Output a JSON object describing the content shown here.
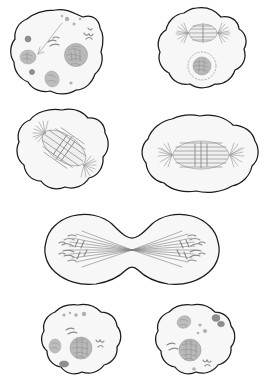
{
  "figure": {
    "style": "grayscale pencil line drawing",
    "background_color": "#ffffff",
    "outline_color": "#1a1a1a",
    "cytoplasm_color": "#f7f7f7",
    "structure_color": "#9b9b9b",
    "nucleus_color": "#b9b9b9",
    "panel_count": 6,
    "layout": "3 rows: two panels, two panels, one wide panel, two panels"
  },
  "panels": [
    {
      "id": "panel-prophase",
      "stage_name": "Prophase",
      "row": 1,
      "column": 1,
      "cell_shape": "round lobed",
      "features": [
        "condensing chromosomes",
        "intact nucleus",
        "cytoplasmic organelles",
        "leader line"
      ],
      "has_spindle": false,
      "has_aster": false,
      "has_nucleus": true,
      "nucleus_outline": "solid"
    },
    {
      "id": "panel-prometaphase",
      "stage_name": "Prometaphase",
      "row": 1,
      "column": 2,
      "cell_shape": "round lobed",
      "features": [
        "early spindle with asters",
        "nuclear envelope breaking down",
        "dashed nuclear envelope"
      ],
      "has_spindle": true,
      "has_aster": true,
      "has_nucleus": true,
      "nucleus_outline": "dashed"
    },
    {
      "id": "panel-metaphase-early",
      "stage_name": "Metaphase (spindle oblique)",
      "row": 2,
      "column": 1,
      "cell_shape": "round lobed",
      "features": [
        "diagonal spindle",
        "asters at both poles",
        "chromosomes on equator"
      ],
      "has_spindle": true,
      "has_aster": true,
      "has_nucleus": false,
      "spindle_orientation": "diagonal"
    },
    {
      "id": "panel-metaphase",
      "stage_name": "Metaphase",
      "row": 2,
      "column": 2,
      "cell_shape": "oval elongated",
      "features": [
        "horizontal spindle",
        "metaphase plate",
        "asters at both poles"
      ],
      "has_spindle": true,
      "has_aster": true,
      "has_nucleus": false,
      "spindle_orientation": "horizontal"
    },
    {
      "id": "panel-anaphase-telophase",
      "stage_name": "Anaphase / Telophase with cleavage furrow",
      "row": 3,
      "column": 1,
      "cell_shape": "dumbbell with cleavage furrow",
      "features": [
        "two chromosome sets at opposite poles",
        "cleavage furrow pinching the cell",
        "spindle fibers converging at each pole"
      ],
      "has_spindle": true,
      "has_aster": true,
      "has_nucleus": false,
      "is_wide": true
    },
    {
      "id": "panel-daughter-cell-left",
      "stage_name": "Daughter cell (interphase)",
      "row": 4,
      "column": 1,
      "cell_shape": "round lobed",
      "features": [
        "reformed nucleus",
        "organelles",
        "small vesicles"
      ],
      "has_spindle": false,
      "has_aster": false,
      "has_nucleus": true,
      "nucleus_outline": "solid"
    },
    {
      "id": "panel-daughter-cell-right",
      "stage_name": "Daughter cell (interphase)",
      "row": 4,
      "column": 2,
      "cell_shape": "round lobed",
      "features": [
        "reformed nucleus",
        "organelles",
        "small vesicles"
      ],
      "has_spindle": false,
      "has_aster": false,
      "has_nucleus": true,
      "nucleus_outline": "solid"
    }
  ]
}
